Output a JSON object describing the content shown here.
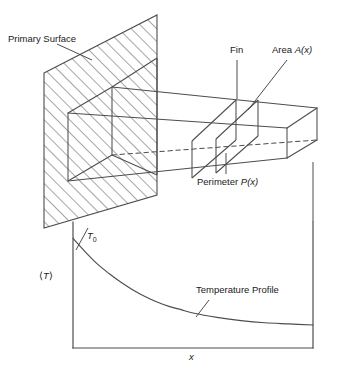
{
  "figure": {
    "line_color": "#4d4d4d",
    "text_color": "#1a1a1a",
    "background": "#ffffff"
  },
  "labels": {
    "primary_surface": "Primary Surface",
    "fin": "Fin",
    "area_prefix": "Area ",
    "area_symbol": "A",
    "area_arg": "(x)",
    "perimeter_prefix": "Perimeter ",
    "perimeter_symbol": "P",
    "perimeter_arg": "(x)",
    "t0_symbol": "T",
    "t0_subscript": "0",
    "avg_t_open": "⟨",
    "avg_t_symbol": "T",
    "avg_t_close": "⟩",
    "temperature_profile": "Temperature Profile",
    "x_axis": "x"
  },
  "chart_data": {
    "type": "line",
    "title": "Temperature Profile",
    "xlabel": "x",
    "ylabel": "⟨T⟩",
    "grid": false,
    "legend": "none",
    "annotations": [
      {
        "text": "T0",
        "x": 0,
        "y": 1.0,
        "note": "base temperature at fin root"
      },
      {
        "text": "Temperature Profile",
        "x": 0.58,
        "y": 0.42,
        "note": "leader line to curve"
      }
    ],
    "axis_box": {
      "left_axis": true,
      "right_axis": true,
      "bottom_axis": true,
      "top_axis": false
    },
    "xlim": [
      0,
      1
    ],
    "ylim": [
      0,
      1.15
    ],
    "series": [
      {
        "name": "Mean fin temperature",
        "x": [
          0.0,
          0.05,
          0.1,
          0.15,
          0.2,
          0.25,
          0.3,
          0.35,
          0.4,
          0.45,
          0.5,
          0.6,
          0.7,
          0.8,
          0.9,
          1.0
        ],
        "values": [
          1.0,
          0.88,
          0.77,
          0.68,
          0.6,
          0.53,
          0.47,
          0.42,
          0.38,
          0.35,
          0.32,
          0.28,
          0.25,
          0.23,
          0.22,
          0.21
        ]
      }
    ]
  },
  "geometry": {
    "primary_surface": {
      "shape": "hatched parallelogram",
      "points": "44,73 157,15 157,195 44,228",
      "hatch_direction": "up-right"
    },
    "fin": {
      "shape": "tapered rectangular box",
      "description": "wide at base on primary surface, narrowing toward tip at right"
    },
    "cross_sections": [
      {
        "name": "section-at-wall",
        "note": "cut plane coincident with primary surface"
      },
      {
        "name": "section-slice-left",
        "note": "left face of highlighted differential slice"
      },
      {
        "name": "section-slice-right",
        "note": "right face of highlighted differential slice"
      }
    ]
  }
}
